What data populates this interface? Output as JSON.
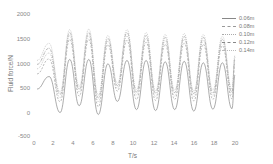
{
  "chart_data": {
    "type": "line",
    "title": "",
    "xlabel": "T/s",
    "ylabel": "Fluid force/N",
    "xlim": [
      0,
      20
    ],
    "ylim": [
      -500,
      2000
    ],
    "xticks": [
      "0",
      "2",
      "4",
      "6",
      "8",
      "10",
      "12",
      "14",
      "16",
      "18",
      "20"
    ],
    "yticks": [
      "2000",
      "1500",
      "1000",
      "500",
      "0",
      "-500"
    ],
    "grid": false,
    "legend_position": "upper right",
    "x": [
      0.3,
      1.5,
      2.6,
      3.1,
      3.6,
      4.1,
      4.5,
      5.0,
      5.5,
      5.9,
      6.4,
      6.9,
      7.3,
      7.8,
      8.3,
      8.7,
      9.2,
      9.7,
      10.1,
      10.6,
      11.1,
      11.5,
      12.0,
      12.5,
      12.9,
      13.4,
      13.9,
      14.3,
      14.8,
      15.3,
      15.7,
      16.2,
      16.7,
      17.1,
      17.6,
      18.1,
      18.5,
      19.0,
      19.5,
      19.9
    ],
    "series": [
      {
        "name": "0.06m",
        "style": "solid",
        "peaks": [
          720,
          1070,
          1070,
          980,
          1050,
          1050,
          1020,
          1030,
          1000,
          1000
        ],
        "troughs": [
          -20,
          120,
          -60,
          210,
          40,
          20,
          40,
          10,
          50,
          60
        ]
      },
      {
        "name": "0.08m",
        "style": "dashed",
        "peaks": [
          1080,
          1480,
          1480,
          1370,
          1460,
          1420,
          1380,
          1400,
          1380,
          1350
        ],
        "troughs": [
          200,
          320,
          100,
          420,
          250,
          230,
          250,
          220,
          250,
          260
        ]
      },
      {
        "name": "0.10m",
        "style": "dotted",
        "peaks": [
          1200,
          1560,
          1560,
          1440,
          1550,
          1500,
          1460,
          1480,
          1460,
          1420
        ],
        "troughs": [
          280,
          400,
          200,
          480,
          340,
          310,
          320,
          300,
          320,
          340
        ]
      },
      {
        "name": "0.12m",
        "style": "dashdot",
        "peaks": [
          1300,
          1620,
          1620,
          1500,
          1620,
          1560,
          1520,
          1540,
          1520,
          1480
        ],
        "troughs": [
          350,
          460,
          280,
          530,
          400,
          380,
          390,
          370,
          380,
          400
        ]
      },
      {
        "name": "0.14m",
        "style": "solid-light",
        "peaks": [
          1400,
          1680,
          1690,
          1560,
          1680,
          1620,
          1580,
          1600,
          1580,
          1540
        ],
        "troughs": [
          400,
          520,
          340,
          580,
          450,
          430,
          440,
          420,
          440,
          460
        ]
      }
    ]
  },
  "axes": {
    "yticks": [
      "2000",
      "1500",
      "1000",
      "500",
      "0",
      "-500"
    ],
    "xticks": [
      "0",
      "2",
      "4",
      "6",
      "8",
      "10",
      "12",
      "14",
      "16",
      "18",
      "20"
    ],
    "xlabel": "T/s",
    "ylabel": "Fluid force/N"
  },
  "legend": [
    "0.06m",
    "0.08m",
    "0.10m",
    "0.12m",
    "0.14m"
  ]
}
